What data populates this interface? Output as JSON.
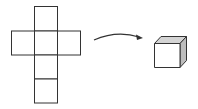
{
  "diagram": {
    "net": {
      "label": "cube-net",
      "squares": [
        {
          "x": 34,
          "y": 6,
          "w": 24,
          "h": 25
        },
        {
          "x": 11,
          "y": 31,
          "w": 23,
          "h": 24
        },
        {
          "x": 34,
          "y": 31,
          "w": 24,
          "h": 24
        },
        {
          "x": 58,
          "y": 31,
          "w": 23,
          "h": 24
        },
        {
          "x": 34,
          "y": 55,
          "w": 24,
          "h": 24
        },
        {
          "x": 34,
          "y": 79,
          "w": 24,
          "h": 24
        }
      ]
    },
    "arrow": {
      "label": "fold-arrow",
      "direction": "right"
    },
    "cube": {
      "label": "cube",
      "top_color": "#d4d4d4",
      "side_color": "#bdbdbd",
      "front_color": "#ffffff"
    },
    "stroke_color": "#333333"
  }
}
